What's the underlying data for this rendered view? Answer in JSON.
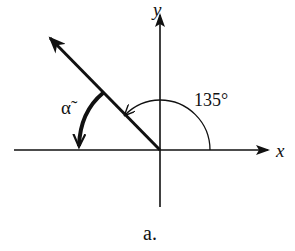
{
  "diagram": {
    "type": "angle-diagram",
    "axes": {
      "x_label": "x",
      "y_label": "y"
    },
    "angle_label": "135°",
    "reference_angle_label": "α̃",
    "caption": "a.",
    "colors": {
      "stroke": "#111111",
      "background": "#ffffff"
    }
  }
}
